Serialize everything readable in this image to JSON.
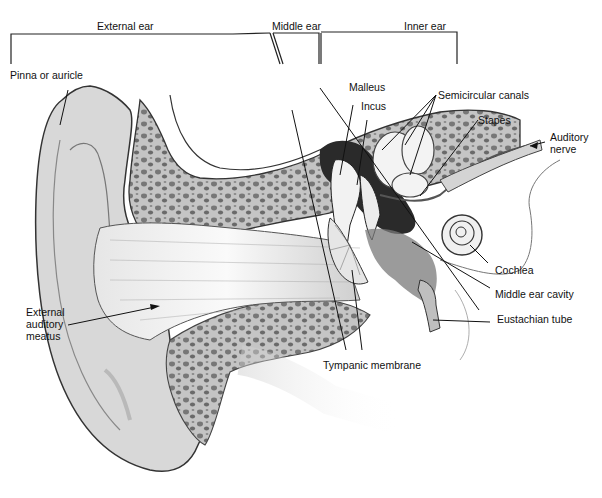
{
  "diagram": {
    "sections": [
      {
        "id": "external",
        "label": "External ear"
      },
      {
        "id": "middle",
        "label": "Middle ear"
      },
      {
        "id": "inner",
        "label": "Inner ear"
      }
    ],
    "labels": {
      "pinna": "Pinna or auricle",
      "malleus": "Malleus",
      "incus": "Incus",
      "semicircular": "Semicircular canals",
      "stapes": "Stapes",
      "auditory_nerve": "Auditory\nnerve",
      "cochlea": "Cochlea",
      "middle_cavity": "Middle ear cavity",
      "eustachian": "Eustachian  tube",
      "tympanic": "Tympanic membrane",
      "meatus": "External\nauditory\nmeatus"
    },
    "colors": {
      "ink": "#1a1a1a",
      "skin": "#d9d9d9",
      "bone": "#bdbdbd",
      "bone_pore": "#6e6e6e",
      "canal": "#f4f4f4",
      "dark_cavity": "#2a2a2a",
      "background": "#ffffff"
    }
  }
}
